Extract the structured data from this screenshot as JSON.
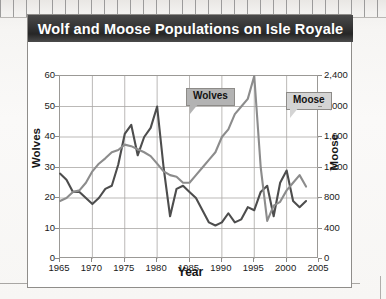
{
  "chart_data": {
    "type": "line",
    "title": "Wolf and Moose Populations on Isle Royale",
    "xlabel": "Year",
    "grid": true,
    "legend_position": "inline-callouts",
    "xlim": [
      1965,
      2005
    ],
    "xticks": [
      "1965",
      "1970",
      "1975",
      "1980",
      "1985",
      "1990",
      "1995",
      "2000",
      "2005"
    ],
    "x": [
      1965,
      1966,
      1967,
      1968,
      1969,
      1970,
      1971,
      1972,
      1973,
      1974,
      1975,
      1976,
      1977,
      1978,
      1979,
      1980,
      1981,
      1982,
      1983,
      1984,
      1985,
      1986,
      1987,
      1988,
      1989,
      1990,
      1991,
      1992,
      1993,
      1994,
      1995,
      1996,
      1997,
      1998,
      1999,
      2000,
      2001,
      2002,
      2003
    ],
    "axes": [
      {
        "side": "left",
        "label": "Wolves",
        "ylim": [
          0,
          60
        ],
        "yticks": [
          "0",
          "10",
          "20",
          "30",
          "40",
          "50",
          "60"
        ],
        "tick_values": [
          0,
          10,
          20,
          30,
          40,
          50,
          60
        ]
      },
      {
        "side": "right",
        "label": "Moose",
        "ylim": [
          0,
          2400
        ],
        "yticks": [
          "0",
          "400",
          "800",
          "1,200",
          "1,600",
          "2,000",
          "2,400"
        ],
        "tick_values": [
          0,
          400,
          800,
          1200,
          1600,
          2000,
          2400
        ]
      }
    ],
    "series": [
      {
        "name": "Wolves",
        "axis": "left",
        "color": "#4d4d4d",
        "callout_label": "Wolves",
        "values": [
          28,
          26,
          22,
          22,
          20,
          18,
          20,
          23,
          24,
          31,
          41,
          44,
          34,
          40,
          43,
          50,
          30,
          14,
          23,
          24,
          22,
          20,
          16,
          12,
          11,
          12,
          15,
          12,
          13,
          17,
          16,
          22,
          24,
          14,
          25,
          29,
          19,
          17,
          19
        ]
      },
      {
        "name": "Moose",
        "axis": "right",
        "color": "#8c8c8c",
        "callout_label": "Moose",
        "values": [
          760,
          800,
          880,
          900,
          1000,
          1150,
          1250,
          1320,
          1400,
          1430,
          1500,
          1480,
          1440,
          1400,
          1350,
          1250,
          1150,
          1100,
          1080,
          1000,
          1000,
          1100,
          1200,
          1300,
          1400,
          1600,
          1700,
          1900,
          2000,
          2100,
          2400,
          1200,
          500,
          700,
          750,
          900,
          1000,
          1100,
          950
        ]
      }
    ]
  }
}
